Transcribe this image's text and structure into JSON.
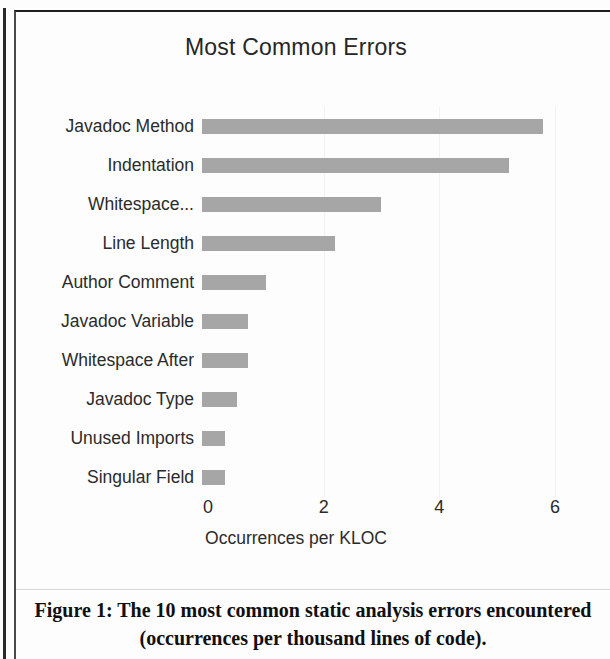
{
  "figure": {
    "caption": "Figure 1: The 10 most common static analysis errors encountered (occurrences per thousand lines of code)."
  },
  "chart_data": {
    "type": "bar",
    "orientation": "horizontal",
    "title": "Most Common Errors",
    "xlabel": "Occurrences per KLOC",
    "ylabel": "",
    "categories": [
      "Javadoc Method",
      "Indentation",
      "Whitespace...",
      "Line Length",
      "Author Comment",
      "Javadoc Variable",
      "Whitespace After",
      "Javadoc Type",
      "Unused Imports",
      "Singular Field"
    ],
    "values": [
      5.9,
      5.3,
      3.1,
      2.3,
      1.1,
      0.8,
      0.8,
      0.6,
      0.4,
      0.4
    ],
    "xlim": [
      0,
      6
    ],
    "xticks": [
      0,
      2,
      4,
      6
    ],
    "xtick_labels": [
      "0",
      "2",
      "4",
      "6"
    ],
    "grid": true,
    "grid_axis": "x",
    "legend": false,
    "bar_color": "#a6a6a6",
    "text_color": "#2b2b2b",
    "background": "#ffffff"
  }
}
